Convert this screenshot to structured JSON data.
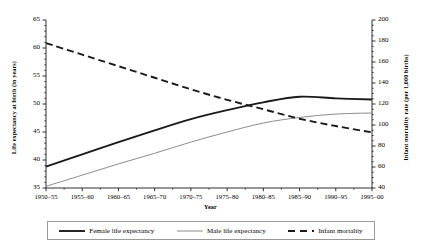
{
  "chart_data": {
    "type": "line",
    "title": "",
    "xlabel": "Year",
    "categories": [
      "1950–55",
      "1955–60",
      "1960–65",
      "1965–70",
      "1970–75",
      "1975–80",
      "1980–85",
      "1985–90",
      "1990–95",
      "1995–00"
    ],
    "grid": false,
    "legend_position": "bottom",
    "axes": {
      "left": {
        "label": "Life expectancy at birth (in years)",
        "ticks": [
          35,
          40,
          45,
          50,
          55,
          60,
          65
        ],
        "ylim": [
          35,
          65
        ],
        "minor_ticks": true
      },
      "right": {
        "label": "Infant mortality rate (per 1,000 births)",
        "ticks": [
          40,
          60,
          80,
          100,
          120,
          140,
          160,
          180,
          200
        ],
        "ylim": [
          40,
          200
        ],
        "minor_ticks": true
      }
    },
    "series": [
      {
        "name": "Female life expectancy",
        "axis": "left",
        "style": "solid-thick",
        "color": "#1a1a1a",
        "values": [
          38.8,
          41.0,
          43.2,
          45.3,
          47.3,
          48.9,
          50.3,
          51.3,
          51.0,
          50.8
        ]
      },
      {
        "name": "Male life expectancy",
        "axis": "left",
        "style": "solid-thin",
        "color": "#8c8c8c",
        "values": [
          35.3,
          37.3,
          39.3,
          41.2,
          43.2,
          45.0,
          46.6,
          47.6,
          48.2,
          48.4
        ]
      },
      {
        "name": "Infant mortality",
        "axis": "right",
        "style": "dashed",
        "color": "#1a1a1a",
        "values": [
          178,
          167,
          156,
          145,
          134,
          124,
          115,
          106,
          99,
          93
        ]
      }
    ]
  },
  "legend": {
    "items": [
      {
        "label": "Female life expectancy",
        "swatch": "solid-thick-line-icon"
      },
      {
        "label": "Male life expectancy",
        "swatch": "solid-thin-line-icon"
      },
      {
        "label": "Infant mortality",
        "swatch": "dashed-line-icon"
      }
    ]
  }
}
